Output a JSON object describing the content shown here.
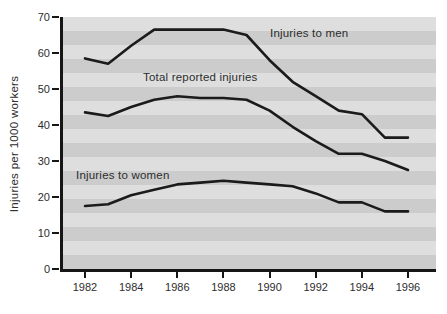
{
  "figure": {
    "background": "#ffffff",
    "stripe_light": "#dedede",
    "stripe_dark": "#cccccc",
    "axis_color": "#161616",
    "line_color": "#1b1b1b",
    "text_color": "#2d2d2d"
  },
  "chart_data": {
    "type": "line",
    "title": "",
    "xlabel": "",
    "ylabel": "Injuries per 1000 workers",
    "ylim": [
      0,
      70
    ],
    "grid": false,
    "background_stripes": true,
    "legend_position": "inline-annotations",
    "y_ticks": [
      0,
      10,
      20,
      30,
      40,
      50,
      60,
      70
    ],
    "x_ticks": [
      1982,
      1984,
      1986,
      1988,
      1990,
      1992,
      1994,
      1996
    ],
    "x": [
      1982,
      1983,
      1984,
      1985,
      1986,
      1987,
      1988,
      1989,
      1990,
      1991,
      1992,
      1993,
      1994,
      1995,
      1996
    ],
    "series": [
      {
        "name": "Injuries to men",
        "values": [
          58.5,
          57,
          62,
          66.5,
          66.5,
          66.5,
          66.5,
          65,
          58,
          52,
          48,
          44,
          43,
          36.5,
          36.5
        ]
      },
      {
        "name": "Total reported injuries",
        "values": [
          43.5,
          42.5,
          45,
          47,
          48,
          47.5,
          47.5,
          47,
          44,
          39.5,
          35.5,
          32,
          32,
          30,
          27.5
        ]
      },
      {
        "name": "Injuries to women",
        "values": [
          17.5,
          18,
          20.5,
          22,
          23.5,
          24,
          24.5,
          24,
          23.5,
          23,
          21,
          18.5,
          18.5,
          16,
          16
        ]
      }
    ]
  }
}
